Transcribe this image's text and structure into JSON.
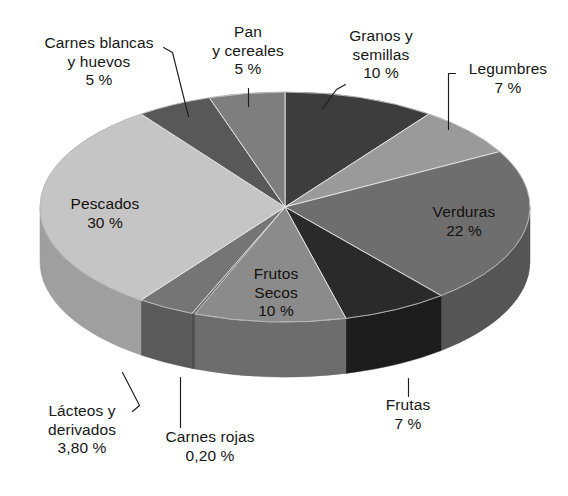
{
  "figure": {
    "title": "",
    "background_color": "#ffffff",
    "text_color": "#171717"
  },
  "chart_data": {
    "type": "pie",
    "title": "",
    "xlabel": "",
    "ylabel": "",
    "style": "3d-exploded-disc",
    "grid": false,
    "legend": "none (direct slice labels with leader lines)",
    "unit": "%",
    "decimal_separator": ",",
    "total": 100,
    "start_angle_deg": 0,
    "direction": "clockwise",
    "categories": [
      "Granos y semillas",
      "Legumbres",
      "Verduras",
      "Frutas",
      "Frutos Secos",
      "Carnes rojas",
      "Lácteos y derivados",
      "Pescados",
      "Carnes blancas y huevos",
      "Pan y cereales"
    ],
    "values": [
      10,
      7,
      22,
      7,
      10,
      0.2,
      3.8,
      30,
      5,
      5
    ],
    "value_labels": [
      "10 %",
      "7 %",
      "22 %",
      "7 %",
      "10 %",
      "0,20 %",
      "3,80 %",
      "30 %",
      "5 %",
      "5 %"
    ],
    "colors": [
      "#3c3c3c",
      "#9a9a9a",
      "#6e6e6e",
      "#2a2a2a",
      "#8b8b8b",
      "#6a6a6a",
      "#757575",
      "#c5c5c5",
      "#585858",
      "#7e7e7e"
    ],
    "side_colors": [
      "#2c2c2c",
      "#7b7b7b",
      "#555555",
      "#1e1e1e",
      "#6d6d6d",
      "#4e4e4e",
      "#5a5a5a",
      "#9f9f9f",
      "#3f3f3f",
      "#616161"
    ]
  },
  "slices": [
    {
      "id": "granos-y-semillas",
      "name": "Granos y\nsemillas",
      "line1": "Granos y",
      "line2": "semillas",
      "value_label": "10 %",
      "value": 10,
      "color": "#3c3c3c"
    },
    {
      "id": "legumbres",
      "name": "Legumbres",
      "line1": "Legumbres",
      "line2": "",
      "value_label": "7 %",
      "value": 7,
      "color": "#9a9a9a"
    },
    {
      "id": "verduras",
      "name": "Verduras",
      "line1": "Verduras",
      "line2": "",
      "value_label": "22 %",
      "value": 22,
      "color": "#6e6e6e"
    },
    {
      "id": "frutas",
      "name": "Frutas",
      "line1": "Frutas",
      "line2": "",
      "value_label": "7 %",
      "value": 7,
      "color": "#2a2a2a"
    },
    {
      "id": "frutos-secos",
      "name": "Frutos Secos",
      "line1": "Frutos",
      "line2": "Secos",
      "value_label": "10 %",
      "value": 10,
      "color": "#8b8b8b"
    },
    {
      "id": "carnes-rojas",
      "name": "Carnes rojas",
      "line1": "Carnes rojas",
      "line2": "",
      "value_label": "0,20 %",
      "value": 0.2,
      "color": "#6a6a6a"
    },
    {
      "id": "lacteos-y-derivados",
      "name": "Lácteos y derivados",
      "line1": "Lácteos y",
      "line2": "derivados",
      "value_label": "3,80 %",
      "value": 3.8,
      "color": "#757575"
    },
    {
      "id": "pescados",
      "name": "Pescados",
      "line1": "Pescados",
      "line2": "",
      "value_label": "30 %",
      "value": 30,
      "color": "#c5c5c5"
    },
    {
      "id": "carnes-blancas-y-huevos",
      "name": "Carnes blancas y huevos",
      "line1": "Carnes blancas",
      "line2": "y huevos",
      "value_label": "5 %",
      "value": 5,
      "color": "#585858"
    },
    {
      "id": "pan-y-cereales",
      "name": "Pan y cereales",
      "line1": "Pan",
      "line2": "y cereales",
      "value_label": "5 %",
      "value": 5,
      "color": "#7e7e7e"
    }
  ]
}
